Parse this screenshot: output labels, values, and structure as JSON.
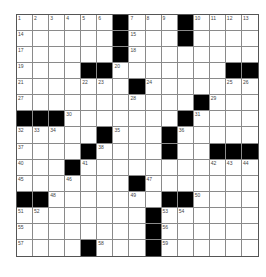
{
  "puzzle": {
    "rows": 15,
    "cols": 15,
    "colors": {
      "black": "#000000",
      "white": "#ffffff",
      "line": "#8a8a8a",
      "number": "#444444"
    },
    "grid": [
      "......#...#....",
      "......#...#....",
      "......#........",
      "....##.......##",
      ".......#.......",
      "...........#...",
      "###.......#....",
      ".....#...#.....",
      "....#....#..###",
      "...#...........",
      ".......#.......",
      "##.......##....",
      "........#......",
      "........#......",
      "....#...#......"
    ],
    "numbers": [
      {
        "r": 0,
        "c": 0,
        "n": "1"
      },
      {
        "r": 0,
        "c": 1,
        "n": "2"
      },
      {
        "r": 0,
        "c": 2,
        "n": "3"
      },
      {
        "r": 0,
        "c": 3,
        "n": "4"
      },
      {
        "r": 0,
        "c": 4,
        "n": "5"
      },
      {
        "r": 0,
        "c": 5,
        "n": "6"
      },
      {
        "r": 0,
        "c": 7,
        "n": "7"
      },
      {
        "r": 0,
        "c": 8,
        "n": "8"
      },
      {
        "r": 0,
        "c": 9,
        "n": "9"
      },
      {
        "r": 0,
        "c": 11,
        "n": "10"
      },
      {
        "r": 0,
        "c": 12,
        "n": "11"
      },
      {
        "r": 0,
        "c": 13,
        "n": "12"
      },
      {
        "r": 0,
        "c": 14,
        "n": "13"
      },
      {
        "r": 1,
        "c": 0,
        "n": "14"
      },
      {
        "r": 1,
        "c": 7,
        "n": "15"
      },
      {
        "r": 1,
        "c": 10,
        "n": "16"
      },
      {
        "r": 2,
        "c": 0,
        "n": "17"
      },
      {
        "r": 2,
        "c": 7,
        "n": "18"
      },
      {
        "r": 3,
        "c": 0,
        "n": "19"
      },
      {
        "r": 3,
        "c": 6,
        "n": "20"
      },
      {
        "r": 4,
        "c": 0,
        "n": "21"
      },
      {
        "r": 4,
        "c": 4,
        "n": "22"
      },
      {
        "r": 4,
        "c": 5,
        "n": "23"
      },
      {
        "r": 4,
        "c": 8,
        "n": "24"
      },
      {
        "r": 4,
        "c": 13,
        "n": "25"
      },
      {
        "r": 4,
        "c": 14,
        "n": "26"
      },
      {
        "r": 5,
        "c": 0,
        "n": "27"
      },
      {
        "r": 5,
        "c": 7,
        "n": "28"
      },
      {
        "r": 5,
        "c": 12,
        "n": "29"
      },
      {
        "r": 6,
        "c": 3,
        "n": "30"
      },
      {
        "r": 6,
        "c": 11,
        "n": "31"
      },
      {
        "r": 7,
        "c": 0,
        "n": "32"
      },
      {
        "r": 7,
        "c": 1,
        "n": "33"
      },
      {
        "r": 7,
        "c": 2,
        "n": "34"
      },
      {
        "r": 7,
        "c": 6,
        "n": "35"
      },
      {
        "r": 7,
        "c": 10,
        "n": "36"
      },
      {
        "r": 8,
        "c": 0,
        "n": "37"
      },
      {
        "r": 8,
        "c": 5,
        "n": "38"
      },
      {
        "r": 8,
        "c": 9,
        "n": "39"
      },
      {
        "r": 9,
        "c": 0,
        "n": "40"
      },
      {
        "r": 9,
        "c": 4,
        "n": "41"
      },
      {
        "r": 9,
        "c": 12,
        "n": "42"
      },
      {
        "r": 9,
        "c": 13,
        "n": "43"
      },
      {
        "r": 9,
        "c": 14,
        "n": "44"
      },
      {
        "r": 10,
        "c": 0,
        "n": "45"
      },
      {
        "r": 10,
        "c": 3,
        "n": "46"
      },
      {
        "r": 10,
        "c": 8,
        "n": "47"
      },
      {
        "r": 11,
        "c": 2,
        "n": "48"
      },
      {
        "r": 11,
        "c": 7,
        "n": "49"
      },
      {
        "r": 11,
        "c": 11,
        "n": "50"
      },
      {
        "r": 12,
        "c": 0,
        "n": "51"
      },
      {
        "r": 12,
        "c": 1,
        "n": "52"
      },
      {
        "r": 12,
        "c": 9,
        "n": "53"
      },
      {
        "r": 12,
        "c": 10,
        "n": "54"
      },
      {
        "r": 13,
        "c": 0,
        "n": "55"
      },
      {
        "r": 13,
        "c": 9,
        "n": "56"
      },
      {
        "r": 14,
        "c": 0,
        "n": "57"
      },
      {
        "r": 14,
        "c": 5,
        "n": "58"
      },
      {
        "r": 14,
        "c": 9,
        "n": "59"
      }
    ]
  }
}
